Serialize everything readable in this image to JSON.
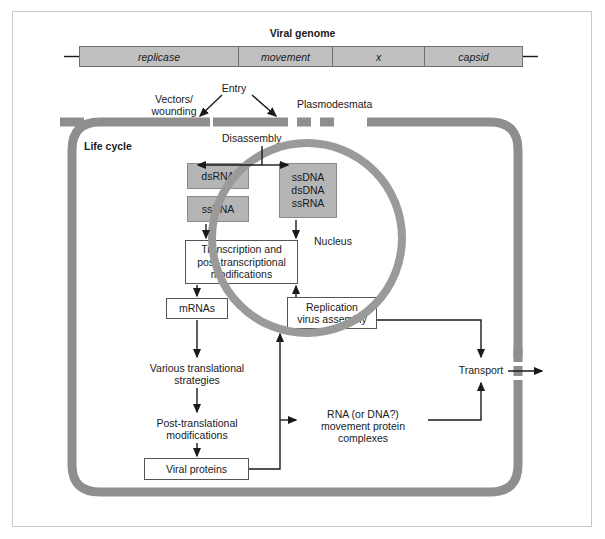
{
  "figure": {
    "title": "Viral genome",
    "life_cycle_label": "Life cycle"
  },
  "genome": {
    "segments": [
      {
        "name": "replicase"
      },
      {
        "name": "movement"
      },
      {
        "name": "x"
      },
      {
        "name": "capsid"
      }
    ]
  },
  "entry": {
    "entry_label": "Entry",
    "vectors_line1": "Vectors/",
    "vectors_line2": "wounding",
    "plasmodesmata_label": "Plasmodesmata",
    "disassembly_label": "Disassembly"
  },
  "nucleic_acids": {
    "cytoplasm_box1": "dsRNA",
    "cytoplasm_box2": "ssRNA",
    "nucleus_box_line1": "ssDNA",
    "nucleus_box_line2": "dsDNA",
    "nucleus_box_line3": "ssRNA"
  },
  "nucleus": {
    "label": "Nucleus"
  },
  "pathway": {
    "transcription_line1": "Transcription and",
    "transcription_line2": "post-transcriptional",
    "transcription_line3": "modifications",
    "mrnas": "mRNAs",
    "translation_line1": "Various translational",
    "translation_line2": "strategies",
    "posttranslational_line1": "Post-translational",
    "posttranslational_line2": "modifications",
    "viral_proteins": "Viral proteins",
    "replication_line1": "Replication",
    "replication_line2": "virus assembly",
    "movement_complex_line1": "RNA (or DNA?)",
    "movement_complex_line2": "movement protein",
    "movement_complex_line3": "complexes",
    "transport": "Transport"
  },
  "colors": {
    "wall": "#8e8e8e",
    "nucleus": "#9a9a9a",
    "gray_box_fill": "#b5b5b5",
    "genome_fill": "#c0c0c0",
    "line": "#1a1a1a",
    "frame_border": "#c9c9c9"
  }
}
